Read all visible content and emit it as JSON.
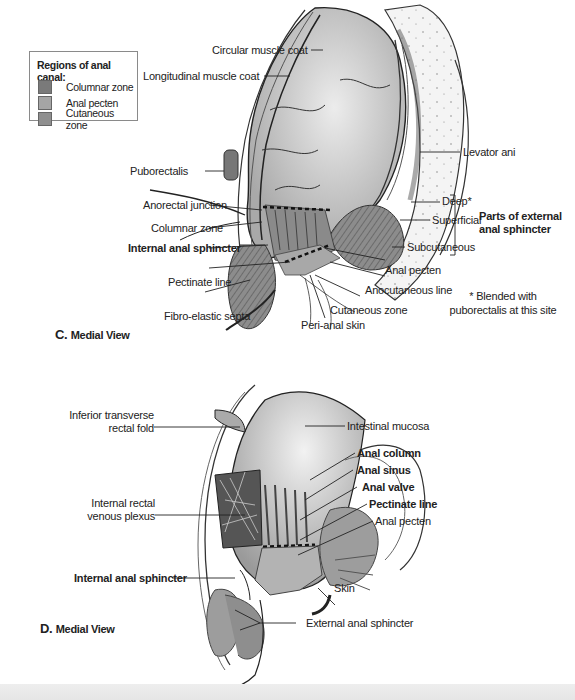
{
  "legend": {
    "title": "Regions of anal canal:",
    "items": [
      {
        "label": "Columnar zone",
        "color": "#7a7a7a"
      },
      {
        "label": "Anal pecten",
        "color": "#a5a5a5"
      },
      {
        "label": "Cutaneous zone",
        "color": "#8f8f8f"
      }
    ]
  },
  "figure_c": {
    "view_letter": "C.",
    "view_title": "Medial View",
    "labels": {
      "circular_muscle_coat": "Circular muscle coat",
      "longitudinal_muscle_coat": "Longitudinal muscle coat",
      "levator_ani": "Levator ani",
      "puborectalis": "Puborectalis",
      "anorectal_junction": "Anorectal junction",
      "deep": "Deep*",
      "superficial": "Superficial",
      "subcutaneous": "Subcutaneous",
      "parts_ext_sphincter_line1": "Parts of external",
      "parts_ext_sphincter_line2": "anal sphincter",
      "columnar_zone": "Columnar zone",
      "internal_anal_sphincter": "Internal anal sphincter",
      "pectinate_line": "Pectinate line",
      "fibro_elastic_septa": "Fibro-elastic septa",
      "anal_pecten": "Anal pecten",
      "anocutaneous_line": "Anocutaneous line",
      "cutaneous_zone": "Cutaneous zone",
      "peri_anal_skin": "Peri-anal skin"
    },
    "footnote_line1": "* Blended with",
    "footnote_line2": "puborectalis at this site"
  },
  "figure_d": {
    "view_letter": "D.",
    "view_title": "Medial View",
    "labels": {
      "inferior_transverse_line1": "Inferior transverse",
      "inferior_transverse_line2": "rectal fold",
      "intestinal_mucosa": "Intestinal mucosa",
      "anal_column": "Anal column",
      "anal_sinus": "Anal sinus",
      "anal_valve": "Anal valve",
      "pectinate_line": "Pectinate line",
      "anal_pecten": "Anal pecten",
      "internal_rectal_line1": "Internal rectal",
      "internal_rectal_line2": "venous plexus",
      "internal_anal_sphincter": "Internal anal sphincter",
      "skin": "Skin",
      "external_anal_sphincter": "External anal sphincter"
    }
  }
}
